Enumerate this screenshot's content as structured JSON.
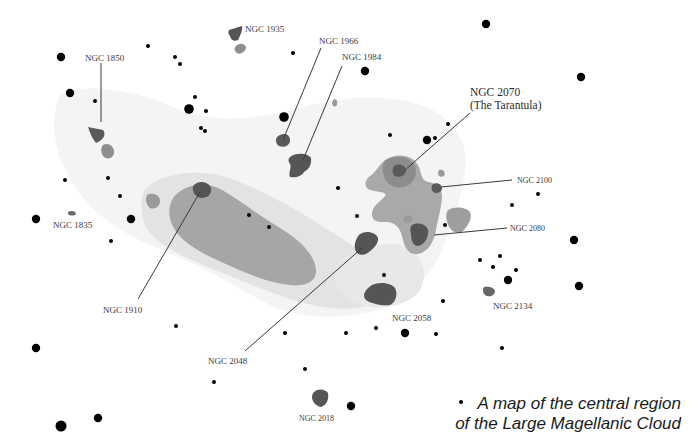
{
  "map": {
    "title": "A map of the central region of the Large Magellanic Cloud",
    "caption_lines": [
      "A map of the central region",
      "of the Large Magellanic Cloud"
    ],
    "colors": {
      "background": "#ffffff",
      "outer_haze": "#f3f3f3",
      "light_region": "#e2e2e2",
      "mid_region": "#a6a6a6",
      "dark_cluster": "#5a5a5a",
      "star": "#000000",
      "label": "#3a3a3a"
    },
    "labels": {
      "ngc1850": "NGC 1850",
      "ngc1935": "NGC 1935",
      "ngc1966": "NGC 1966",
      "ngc1984": "NGC 1984",
      "ngc2070_line1": "NGC 2070",
      "ngc2070_line2": "(The Tarantula)",
      "ngc2100": "NGC 2100",
      "ngc2080": "NGC 2080",
      "ngc1835": "NGC 1835",
      "ngc1910": "NGC 1910",
      "ngc2048": "NGC 2048",
      "ngc2058": "NGC 2058",
      "ngc2134": "NGC 2134",
      "ngc2018": "NGC 2018"
    },
    "objects": [
      {
        "name": "NGC 1850",
        "type": "cluster"
      },
      {
        "name": "NGC 1935",
        "type": "cluster"
      },
      {
        "name": "NGC 1966",
        "type": "cluster"
      },
      {
        "name": "NGC 1984",
        "type": "cluster"
      },
      {
        "name": "NGC 2070",
        "alias": "The Tarantula",
        "type": "nebula"
      },
      {
        "name": "NGC 2100",
        "type": "cluster"
      },
      {
        "name": "NGC 2080",
        "type": "nebula"
      },
      {
        "name": "NGC 1835",
        "type": "cluster"
      },
      {
        "name": "NGC 1910",
        "type": "cluster"
      },
      {
        "name": "NGC 2048",
        "type": "nebula"
      },
      {
        "name": "NGC 2058",
        "type": "cluster"
      },
      {
        "name": "NGC 2134",
        "type": "cluster"
      },
      {
        "name": "NGC 2018",
        "type": "nebula"
      }
    ]
  }
}
